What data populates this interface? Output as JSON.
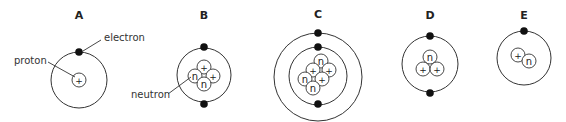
{
  "atoms": [
    {
      "label": "A",
      "x": 79,
      "lx": 79,
      "ly": 19,
      "orbits": [
        {
          "cx": 79,
          "cy": 80,
          "r": 28
        }
      ],
      "electrons": [
        {
          "x": 79,
          "y": 52
        }
      ],
      "nucleus": [
        {
          "t": "p",
          "x": 79,
          "y": 80
        }
      ]
    },
    {
      "label": "B",
      "lx": 204,
      "ly": 19,
      "orbits": [
        {
          "cx": 204,
          "cy": 75,
          "r": 27
        }
      ],
      "electrons": [
        {
          "x": 204,
          "y": 47
        },
        {
          "x": 204,
          "y": 104
        }
      ],
      "nucleus": [
        {
          "t": "p",
          "x": 204,
          "y": 67
        },
        {
          "t": "n",
          "x": 195,
          "y": 76
        },
        {
          "t": "p",
          "x": 213,
          "y": 76
        },
        {
          "t": "n",
          "x": 204,
          "y": 84
        }
      ]
    },
    {
      "label": "C",
      "lx": 318,
      "ly": 18,
      "orbits": [
        {
          "cx": 318,
          "cy": 77,
          "r": 44
        },
        {
          "cx": 318,
          "cy": 76,
          "r": 29
        }
      ],
      "electrons": [
        {
          "x": 318,
          "y": 33
        },
        {
          "x": 318,
          "y": 47
        },
        {
          "x": 318,
          "y": 104
        }
      ],
      "nucleus": [
        {
          "t": "n",
          "x": 321,
          "y": 61
        },
        {
          "t": "p",
          "x": 313,
          "y": 70
        },
        {
          "t": "p",
          "x": 329,
          "y": 70
        },
        {
          "t": "n",
          "x": 305,
          "y": 79
        },
        {
          "t": "p",
          "x": 322,
          "y": 79
        },
        {
          "t": "n",
          "x": 313,
          "y": 88
        }
      ]
    },
    {
      "label": "D",
      "lx": 430,
      "ly": 19,
      "orbits": [
        {
          "cx": 430,
          "cy": 64,
          "r": 28
        }
      ],
      "electrons": [
        {
          "x": 430,
          "y": 36
        },
        {
          "x": 430,
          "y": 93
        }
      ],
      "nucleus": [
        {
          "t": "n",
          "x": 430,
          "y": 57
        },
        {
          "t": "p",
          "x": 423,
          "y": 69
        },
        {
          "t": "p",
          "x": 437,
          "y": 69
        }
      ]
    },
    {
      "label": "E",
      "lx": 524,
      "ly": 19,
      "orbits": [
        {
          "cx": 524,
          "cy": 58,
          "r": 27
        }
      ],
      "electrons": [
        {
          "x": 524,
          "y": 31
        }
      ],
      "nucleus": [
        {
          "t": "p",
          "x": 518,
          "y": 55
        },
        {
          "t": "n",
          "x": 529,
          "y": 61
        }
      ]
    }
  ],
  "callouts": {
    "electron": {
      "text": "electron",
      "x": 104,
      "y": 41,
      "line": [
        83,
        51,
        101,
        40
      ]
    },
    "proton": {
      "text": "proton",
      "x": 14,
      "y": 64,
      "line": [
        48,
        62,
        75,
        77
      ]
    },
    "neutron": {
      "text": "neutron",
      "x": 131,
      "y": 98,
      "line": [
        168,
        94,
        191,
        77
      ]
    }
  },
  "symbols": {
    "p": "+",
    "n": "n"
  }
}
